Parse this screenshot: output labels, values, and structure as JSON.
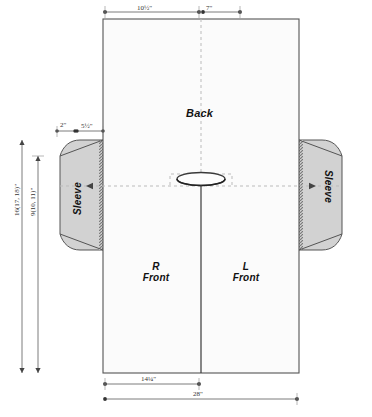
{
  "diagram": {
    "labels": {
      "back": "Back",
      "right_front_line1": "R",
      "right_front_line2": "Front",
      "left_front_line1": "L",
      "left_front_line2": "Front",
      "sleeve_left": "Sleeve",
      "sleeve_right": "Sleeve"
    },
    "dimensions": {
      "top_left": "10½\"",
      "top_right": "7\"",
      "upper_left_small": "2\"",
      "upper_left_shoulder": "5½\"",
      "side_outer": "16(17, 18)\"",
      "side_inner": "9(10, 11)\"",
      "bottom_inner": "14¼\"",
      "bottom_outer": "28\""
    },
    "colors": {
      "sleeve_fill": "#d2d2d2",
      "body_fill": "#fbfbfb",
      "outline": "#4a4a4a",
      "dimension_line": "#6d6d6d",
      "guide_dashed": "#b9b9b9"
    }
  }
}
